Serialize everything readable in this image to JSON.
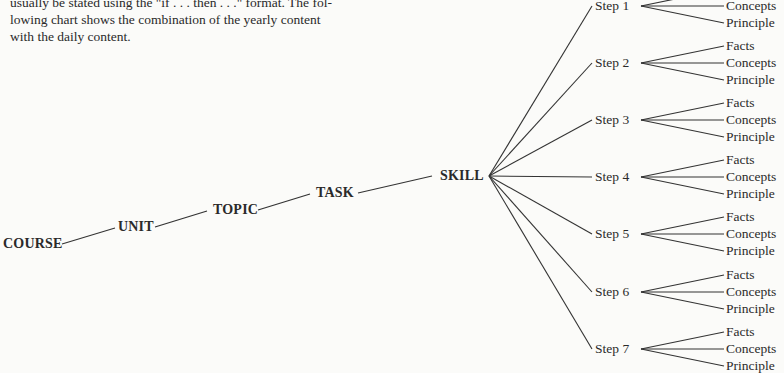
{
  "paragraph": {
    "lines": [
      "usually be stated using the \"if . . . then . . .\" format. The fol-",
      "lowing chart shows the combination of the yearly content",
      "with the daily content."
    ]
  },
  "hierarchy": {
    "course": "COURSE",
    "unit": "UNIT",
    "topic": "TOPIC",
    "task": "TASK",
    "skill": "SKILL"
  },
  "steps": [
    {
      "label": "Step 1",
      "leaves": [
        "Facts",
        "Concepts",
        "Principle"
      ]
    },
    {
      "label": "Step 2",
      "leaves": [
        "Facts",
        "Concepts",
        "Principle"
      ]
    },
    {
      "label": "Step 3",
      "leaves": [
        "Facts",
        "Concepts",
        "Principle"
      ]
    },
    {
      "label": "Step 4",
      "leaves": [
        "Facts",
        "Concepts",
        "Principle"
      ]
    },
    {
      "label": "Step 5",
      "leaves": [
        "Facts",
        "Concepts",
        "Principle"
      ]
    },
    {
      "label": "Step 6",
      "leaves": [
        "Facts",
        "Concepts",
        "Principle"
      ]
    },
    {
      "label": "Step 7",
      "leaves": [
        "Facts",
        "Concepts",
        "Principle"
      ]
    }
  ]
}
